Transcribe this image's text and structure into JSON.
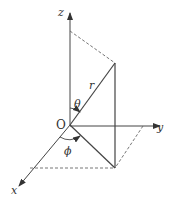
{
  "diagram": {
    "axes": {
      "x": {
        "label": "x"
      },
      "y": {
        "label": "y"
      },
      "z": {
        "label": "z"
      }
    },
    "origin_label": "O",
    "radius_label": "r",
    "polar_angle_label": "θ",
    "azimuth_angle_label": "ϕ",
    "colors": {
      "line": "#444444",
      "dashed": "#666666",
      "background": "#ffffff"
    }
  }
}
